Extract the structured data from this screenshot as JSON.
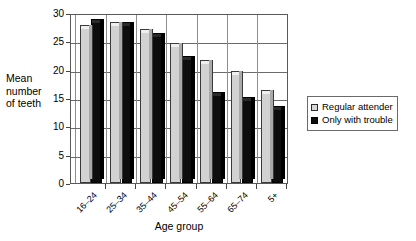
{
  "chart_data": {
    "type": "bar",
    "title": "",
    "xlabel": "Age group",
    "ylabel": "Mean number of teeth",
    "ylabel_lines": [
      "Mean",
      "number",
      "of teeth"
    ],
    "categories": [
      "16–24",
      "25–34",
      "35–44",
      "45–54",
      "55–64",
      "65–74",
      "5+"
    ],
    "series": [
      {
        "name": "Regular attender",
        "color": "#d2d2d2",
        "values": [
          27.5,
          28.0,
          26.8,
          24.4,
          21.3,
          19.4,
          16.0
        ]
      },
      {
        "name": "Only with trouble",
        "color": "#0d0d0d",
        "values": [
          28.6,
          28.1,
          26.1,
          22.0,
          15.7,
          14.8,
          13.3
        ]
      }
    ],
    "ylim": [
      0,
      30
    ],
    "yticks": [
      0,
      5,
      10,
      15,
      20,
      25,
      30
    ],
    "ytick_labels": [
      "0",
      "5",
      "10",
      "15",
      "20",
      "25",
      "30"
    ],
    "grid": true,
    "grid_axis": "y",
    "legend_position": "right"
  },
  "legend": {
    "items": [
      {
        "label": "Regular attender",
        "swatch": "light-square-icon"
      },
      {
        "label": "Only with trouble",
        "swatch": "dark-square-icon"
      }
    ]
  }
}
